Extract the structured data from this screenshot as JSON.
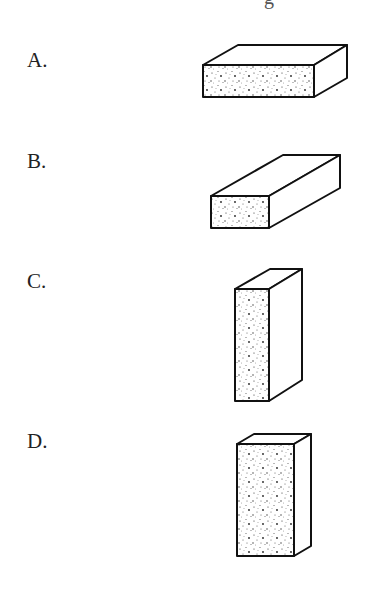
{
  "header": {
    "cut_off_text": "g"
  },
  "options": [
    {
      "label": "A.",
      "shape": "wide flat box, dotted front face"
    },
    {
      "label": "B.",
      "shape": "long box extending back, small dotted end face"
    },
    {
      "label": "C.",
      "shape": "tall thin box, dotted narrow front face"
    },
    {
      "label": "D.",
      "shape": "tall box, dotted wide front face"
    }
  ],
  "colors": {
    "stroke": "#111111",
    "text": "#222222",
    "background": "#ffffff"
  }
}
